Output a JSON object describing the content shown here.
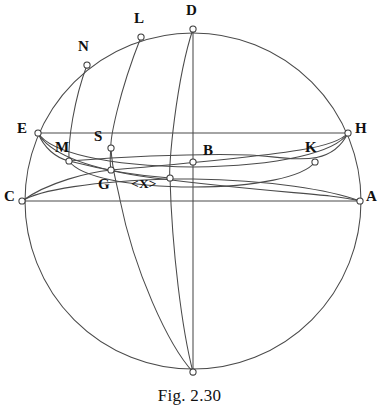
{
  "figure": {
    "caption": "Fig. 2.30",
    "stroke_color": "#4a4a4a",
    "vertex_fill": "#ffffff",
    "label_color": "#111111",
    "background": "#ffffff"
  },
  "sphere": {
    "center_x": 193,
    "center_y": 201,
    "radius": 168
  },
  "points": [
    {
      "id": "D",
      "label": "D",
      "x": 193,
      "y": 29,
      "label_x": 186,
      "label_y": 3
    },
    {
      "id": "L",
      "label": "L",
      "x": 141,
      "y": 37,
      "label_x": 134,
      "label_y": 11
    },
    {
      "id": "N",
      "label": "N",
      "x": 87,
      "y": 65,
      "label_x": 78,
      "label_y": 39
    },
    {
      "id": "E",
      "label": "E",
      "x": 38,
      "y": 133,
      "label_x": 17,
      "label_y": 121
    },
    {
      "id": "H",
      "label": "H",
      "x": 348,
      "y": 133,
      "label_x": 355,
      "label_y": 121
    },
    {
      "id": "M",
      "label": "M",
      "x": 69,
      "y": 161,
      "label_x": 55,
      "label_y": 140
    },
    {
      "id": "S",
      "label": "S",
      "x": 111,
      "y": 148,
      "label_x": 94,
      "label_y": 129
    },
    {
      "id": "B",
      "label": "B",
      "x": 193,
      "y": 162,
      "label_x": 203,
      "label_y": 143
    },
    {
      "id": "K",
      "label": "K",
      "x": 315,
      "y": 162,
      "label_x": 305,
      "label_y": 140
    },
    {
      "id": "G",
      "label": "G",
      "x": 111,
      "y": 170,
      "label_x": 98,
      "label_y": 177
    },
    {
      "id": "X",
      "label": "<X>",
      "x": 170,
      "y": 178,
      "label_x": 131,
      "label_y": 177
    },
    {
      "id": "C",
      "label": "C",
      "x": 22,
      "y": 201,
      "label_x": 4,
      "label_y": 189
    },
    {
      "id": "A",
      "label": "A",
      "x": 360,
      "y": 201,
      "label_x": 366,
      "label_y": 189
    },
    {
      "id": "P",
      "label": "",
      "x": 193,
      "y": 372,
      "label_x": 0,
      "label_y": 0
    }
  ],
  "chords": [
    {
      "name": "chord-EH",
      "from": "E",
      "to": "H"
    },
    {
      "name": "chord-CA",
      "from": "C",
      "to": "A"
    },
    {
      "name": "axis-DP",
      "from": "D",
      "to": "P"
    }
  ],
  "meridians": [
    {
      "name": "meridian-D-pole",
      "from": "D",
      "to": "P"
    },
    {
      "name": "meridian-L-pole",
      "from": "L",
      "to": "P"
    },
    {
      "name": "meridian-N-M",
      "from": "N",
      "to": "M"
    }
  ],
  "small_circles": [
    {
      "name": "circle-E-S-K-H",
      "left": "E",
      "right": "H"
    },
    {
      "name": "circle-M-G-B-K",
      "left": "M",
      "right": "K"
    },
    {
      "name": "circle-C-G-X-A",
      "left": "C",
      "right": "A"
    }
  ]
}
